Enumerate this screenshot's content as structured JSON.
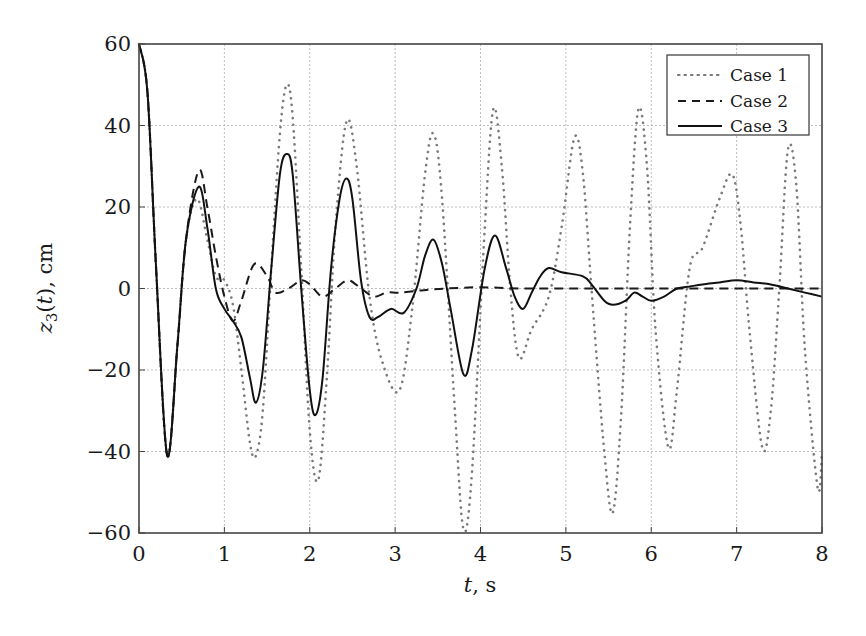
{
  "chart_data": {
    "type": "line",
    "title": "",
    "xlabel": "t, s",
    "ylabel": "z3(t), cm",
    "xlim": [
      0,
      8
    ],
    "ylim": [
      -60,
      60
    ],
    "xticks": [
      0,
      1,
      2,
      3,
      4,
      5,
      6,
      7,
      8
    ],
    "yticks": [
      -60,
      -40,
      -20,
      0,
      20,
      40,
      60
    ],
    "xtick_labels": [
      "0",
      "1",
      "2",
      "3",
      "4",
      "5",
      "6",
      "7",
      "8"
    ],
    "ytick_labels": [
      "−60",
      "−40",
      "−20",
      "0",
      "20",
      "40",
      "60"
    ],
    "grid": true,
    "legend_position": "upper right",
    "series": [
      {
        "name": "Case 1",
        "style": "dotted",
        "color": "#7a7a7a",
        "x": [
          0,
          0.1,
          0.2,
          0.33,
          0.45,
          0.55,
          0.68,
          0.8,
          0.9,
          1.0,
          1.1,
          1.2,
          1.3,
          1.37,
          1.45,
          1.55,
          1.65,
          1.73,
          1.8,
          1.9,
          2.0,
          2.1,
          2.2,
          2.3,
          2.43,
          2.55,
          2.7,
          2.85,
          3.05,
          3.2,
          3.35,
          3.45,
          3.55,
          3.7,
          3.8,
          3.9,
          4.05,
          4.15,
          4.25,
          4.35,
          4.45,
          4.6,
          4.8,
          4.95,
          5.1,
          5.2,
          5.3,
          5.45,
          5.55,
          5.65,
          5.75,
          5.85,
          5.95,
          6.05,
          6.2,
          6.3,
          6.45,
          6.6,
          6.8,
          6.95,
          7.05,
          7.15,
          7.3,
          7.4,
          7.5,
          7.6,
          7.7,
          7.8,
          7.95,
          8.0
        ],
        "values": [
          60,
          48,
          5,
          -41,
          -14,
          12,
          22,
          12,
          3,
          2,
          -4,
          -20,
          -38,
          -41,
          -30,
          5,
          38,
          50,
          42,
          5,
          -35,
          -47,
          -22,
          15,
          41,
          30,
          -2,
          -18,
          -25,
          -5,
          28,
          38,
          22,
          -30,
          -59,
          -45,
          15,
          44,
          30,
          0,
          -17,
          -10,
          -2,
          15,
          37,
          28,
          0,
          -40,
          -55,
          -30,
          15,
          44,
          30,
          -10,
          -39,
          -25,
          5,
          10,
          22,
          28,
          15,
          -10,
          -39,
          -30,
          0,
          34,
          25,
          -15,
          -49,
          -40
        ]
      },
      {
        "name": "Case 2",
        "style": "dashed",
        "color": "#1a1a1a",
        "x": [
          0,
          0.1,
          0.2,
          0.33,
          0.45,
          0.55,
          0.7,
          0.8,
          0.9,
          1.0,
          1.1,
          1.2,
          1.35,
          1.5,
          1.6,
          1.75,
          1.9,
          2.0,
          2.15,
          2.3,
          2.45,
          2.6,
          2.75,
          2.9,
          3.05,
          3.3,
          3.6,
          4.0,
          4.5,
          5.0,
          6.0,
          7.0,
          8.0
        ],
        "values": [
          60,
          48,
          5,
          -41,
          -14,
          12,
          29,
          20,
          8,
          -2,
          -8,
          -3,
          6,
          3,
          -1,
          0,
          2,
          1,
          -2,
          0,
          2,
          0,
          -2,
          -1,
          -1,
          -0.5,
          0,
          0.3,
          0,
          0,
          0,
          0,
          0
        ]
      },
      {
        "name": "Case 3",
        "style": "solid",
        "color": "#111111",
        "x": [
          0,
          0.1,
          0.2,
          0.33,
          0.45,
          0.55,
          0.7,
          0.8,
          0.9,
          1.0,
          1.1,
          1.2,
          1.3,
          1.37,
          1.45,
          1.55,
          1.65,
          1.73,
          1.8,
          1.9,
          2.0,
          2.07,
          2.15,
          2.25,
          2.35,
          2.43,
          2.5,
          2.6,
          2.7,
          2.8,
          2.95,
          3.1,
          3.25,
          3.35,
          3.45,
          3.55,
          3.65,
          3.8,
          3.9,
          4.05,
          4.17,
          4.3,
          4.4,
          4.5,
          4.6,
          4.7,
          4.8,
          4.95,
          5.2,
          5.3,
          5.45,
          5.55,
          5.7,
          5.8,
          5.9,
          6.0,
          6.15,
          6.3,
          6.45,
          6.6,
          6.8,
          7.0,
          7.2,
          7.4,
          7.6,
          7.8,
          8.0
        ],
        "values": [
          60,
          48,
          5,
          -41,
          -14,
          12,
          25,
          15,
          0,
          -5,
          -8,
          -12,
          -22,
          -28,
          -20,
          5,
          28,
          33,
          28,
          0,
          -25,
          -31,
          -22,
          5,
          22,
          27,
          22,
          2,
          -7,
          -7,
          -5,
          -6,
          0,
          8,
          12,
          6,
          -5,
          -21,
          -15,
          5,
          13,
          5,
          -2,
          -5,
          -1,
          3,
          5,
          4,
          3,
          1,
          -3,
          -4,
          -3,
          -1,
          -2,
          -3,
          -2,
          0,
          0.5,
          1,
          1.5,
          2,
          1.5,
          1,
          0,
          -1,
          -2
        ]
      }
    ]
  },
  "legend": {
    "items": [
      {
        "label": "Case 1"
      },
      {
        "label": "Case 2"
      },
      {
        "label": "Case 3"
      }
    ]
  },
  "axes": {
    "xlabel_italic": "t",
    "xlabel_rest": ", s",
    "ylabel_main": "z",
    "ylabel_sub": "3",
    "ylabel_paren_open": "(",
    "ylabel_var": "t",
    "ylabel_rest": "), cm"
  },
  "colors": {
    "frame": "#444444",
    "grid": "#bdbdbd",
    "case1": "#7a7a7a",
    "case2": "#1a1a1a",
    "case3": "#111111"
  }
}
